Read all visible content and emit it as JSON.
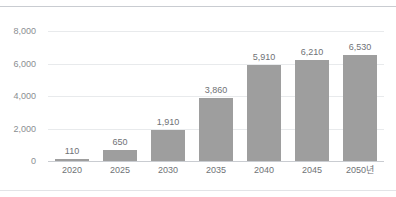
{
  "chart_data": {
    "type": "bar",
    "title": "",
    "subtitle": "",
    "xlabel": "",
    "ylabel": "",
    "categories": [
      "2020",
      "2025",
      "2030",
      "2035",
      "2040",
      "2045",
      "2050년"
    ],
    "values": [
      110,
      650,
      1910,
      3860,
      5910,
      6210,
      6530
    ],
    "value_labels": [
      "110",
      "650",
      "1,910",
      "3,860",
      "5,910",
      "6,210",
      "6,530"
    ],
    "ylim": [
      0,
      8000
    ],
    "yticks": [
      0,
      2000,
      4000,
      6000,
      8000
    ],
    "ytick_labels": [
      "0",
      "2,000",
      "4,000",
      "6,000",
      "8,000"
    ],
    "grid": true,
    "legend": false,
    "legend_position": "none",
    "series": [
      {
        "name": "",
        "values": [
          110,
          650,
          1910,
          3860,
          5910,
          6210,
          6530
        ],
        "color": "#9e9e9e"
      }
    ]
  },
  "style": {
    "bar_color": "#9e9e9e",
    "gridline_color": "#e8eaec",
    "axis_color": "#c9ccd1",
    "value_label_color": "#6f7276",
    "tick_label_color": "#8a8d91",
    "background": "#ffffff"
  }
}
